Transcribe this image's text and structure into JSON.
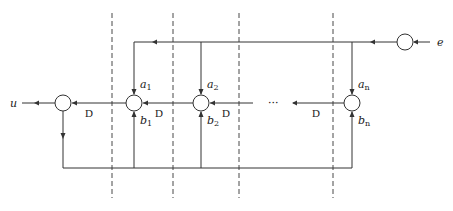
{
  "diagram": {
    "type": "signal-flow / filter structure",
    "input_label": "e",
    "output_label": "u",
    "delay_label": "D",
    "ellipsis": "···",
    "stages": [
      {
        "a": "a",
        "a_sub": "1",
        "b": "b",
        "b_sub": "1"
      },
      {
        "a": "a",
        "a_sub": "2",
        "b": "b",
        "b_sub": "2"
      },
      {
        "a": "a",
        "a_sub": "n",
        "b": "b",
        "b_sub": "n"
      }
    ],
    "delays": [
      "D",
      "D",
      "D",
      "D"
    ],
    "dashed_dividers": 4,
    "colors": {
      "stroke": "#333333",
      "background": "#ffffff"
    }
  }
}
